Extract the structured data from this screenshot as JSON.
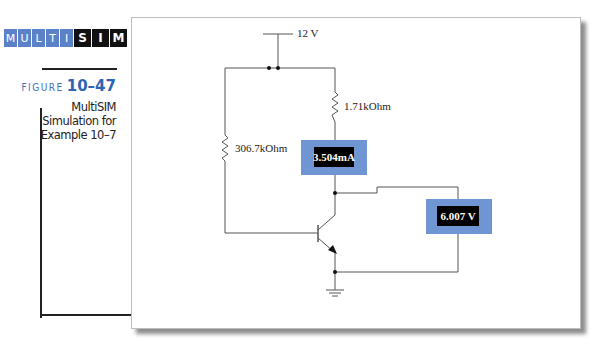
{
  "logo": {
    "letters_blue": [
      "M",
      "U",
      "L",
      "T",
      "I"
    ],
    "letters_black": [
      "S",
      "I",
      "M"
    ]
  },
  "figure": {
    "word": "FIGURE",
    "number": "10–47",
    "caption_lines": [
      "MultiSIM",
      "Simulation for",
      "Example 10–7"
    ]
  },
  "circuit": {
    "supply_label": "12 V",
    "r_collector_label": "1.71kOhm",
    "r_base_label": "306.7kOhm",
    "ammeter_reading": "3.504mA",
    "voltmeter_reading": "6.007 V",
    "meter_color": "#6f96d2"
  }
}
